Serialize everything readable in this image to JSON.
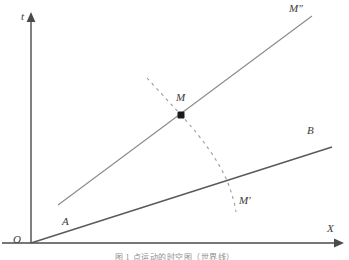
{
  "figure": {
    "caption": "图 1   点运动的时空图（世界线）",
    "background_color": "#ffffff",
    "width": 349,
    "height": 260
  },
  "axes": {
    "vertical": {
      "label": "t",
      "name": "time-axis",
      "color": "#4a4a4a"
    },
    "horizontal": {
      "label": "X",
      "name": "space-axis",
      "color": "#4a4a4a"
    },
    "origin": {
      "label": "O",
      "color": "#3a3a3a"
    }
  },
  "lines": {
    "worldline_OB": {
      "label_start": "A",
      "label_end": "B",
      "color": "#5a5a5a",
      "style": "solid",
      "x1": 31,
      "y1": 243,
      "x2": 332,
      "y2": 147
    },
    "worldline_M2": {
      "label_end": "M″",
      "color": "#8a8a8a",
      "style": "solid",
      "x1": 58,
      "y1": 205,
      "x2": 312,
      "y2": 16
    },
    "dashed_arc": {
      "label_end": "M′",
      "color": "#9a9a9a",
      "style": "dashed",
      "dash_pattern": "3 4"
    }
  },
  "points": {
    "M": {
      "label": "M",
      "x": 181,
      "y": 115,
      "marker": "filled-square-dot",
      "color": "#1a1a1a"
    }
  },
  "colors": {
    "ink": "#3a3a3a",
    "line_dark": "#5a5a5a",
    "line_light": "#8a8a8a",
    "dashed": "#9a9a9a",
    "caption": "#8e8e8e"
  }
}
